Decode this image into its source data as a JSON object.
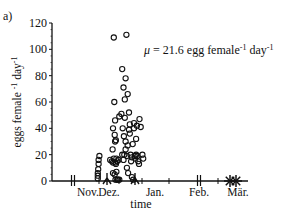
{
  "panel_label": "a)",
  "annotation": {
    "mu": "μ = 21.6 egg female",
    "sup1": "-1",
    "day": " day",
    "sup2": "-1"
  },
  "chart_data": {
    "type": "scatter",
    "title": "",
    "panel": "a)",
    "xlabel": "time",
    "ylabel": "eggs female-1 day-1",
    "ylim": [
      0,
      120
    ],
    "yticks": [
      0,
      20,
      40,
      60,
      80,
      100,
      120
    ],
    "xticklabels": [
      "Nov.",
      "Dez.",
      "Jan.",
      "Feb.",
      "Mär."
    ],
    "grid": false,
    "legend": null,
    "annotations": [
      "μ = 21.6 egg female-1 day-1"
    ],
    "series": [
      {
        "name": "eggs per female per day",
        "marker": "open-circle",
        "points_px_x": [
          78,
          78,
          78,
          80,
          80,
          81,
          82,
          91,
          93,
          95,
          96,
          97,
          97,
          99,
          99,
          100,
          101,
          101,
          102,
          102,
          103,
          103,
          104,
          104,
          105,
          105,
          106,
          106,
          107,
          108,
          108,
          109,
          110,
          111,
          112,
          113,
          114,
          115,
          116,
          117,
          118,
          119,
          119,
          120,
          121,
          122,
          122,
          123,
          123,
          124,
          124,
          125,
          125,
          126,
          126,
          127,
          128,
          129,
          130,
          131,
          132,
          133,
          134,
          136,
          137,
          138,
          139,
          140,
          141,
          142,
          143,
          144,
          145,
          146,
          147,
          148,
          128,
          130,
          131,
          132,
          133,
          134,
          135,
          136,
          137,
          138,
          140,
          141,
          142,
          143,
          144,
          145,
          146,
          147,
          148,
          149,
          150
        ],
        "points": [
          [
            0.62,
            2
          ],
          [
            0.62,
            4
          ],
          [
            0.62,
            6
          ],
          [
            0.63,
            9
          ],
          [
            0.64,
            13
          ],
          [
            0.64,
            16
          ],
          [
            0.66,
            19
          ],
          [
            0.93,
            16
          ],
          [
            0.97,
            15
          ],
          [
            0.99,
            24
          ],
          [
            1.0,
            14
          ],
          [
            1.0,
            6
          ],
          [
            1.0,
            40
          ],
          [
            1.02,
            109
          ],
          [
            1.02,
            17
          ],
          [
            1.03,
            60
          ],
          [
            1.04,
            35
          ],
          [
            1.04,
            5
          ],
          [
            1.05,
            46
          ],
          [
            1.05,
            30
          ],
          [
            1.06,
            14
          ],
          [
            1.06,
            1
          ],
          [
            1.07,
            13
          ],
          [
            1.07,
            31
          ],
          [
            1.08,
            17
          ],
          [
            1.08,
            7
          ],
          [
            1.1,
            15
          ],
          [
            1.1,
            1
          ],
          [
            1.12,
            1
          ],
          [
            1.13,
            16
          ],
          [
            1.15,
            1
          ],
          [
            1.15,
            49
          ],
          [
            1.2,
            51
          ],
          [
            1.22,
            85
          ],
          [
            1.22,
            20
          ],
          [
            1.23,
            40
          ],
          [
            1.25,
            71
          ],
          [
            1.25,
            16
          ],
          [
            1.26,
            34
          ],
          [
            1.27,
            20
          ],
          [
            1.28,
            62
          ],
          [
            1.28,
            48
          ],
          [
            1.3,
            78
          ],
          [
            1.3,
            30
          ],
          [
            1.3,
            24
          ],
          [
            1.32,
            111
          ],
          [
            1.33,
            19
          ],
          [
            1.33,
            10
          ],
          [
            1.35,
            66
          ],
          [
            1.35,
            27
          ],
          [
            1.36,
            6
          ],
          [
            1.38,
            52
          ],
          [
            1.38,
            39
          ],
          [
            1.4,
            43
          ],
          [
            1.4,
            36
          ],
          [
            1.42,
            20
          ],
          [
            1.43,
            15
          ],
          [
            1.45,
            18
          ],
          [
            1.45,
            3
          ],
          [
            1.47,
            28
          ],
          [
            1.48,
            1
          ],
          [
            1.5,
            44
          ],
          [
            1.5,
            40
          ],
          [
            1.52,
            19
          ],
          [
            1.53,
            17
          ],
          [
            1.55,
            32
          ],
          [
            1.55,
            20
          ],
          [
            1.57,
            42
          ],
          [
            1.58,
            19
          ],
          [
            1.6,
            15
          ],
          [
            1.62,
            13
          ],
          [
            1.63,
            47
          ],
          [
            1.66,
            41
          ],
          [
            1.7,
            20
          ],
          [
            1.72,
            17
          ]
        ]
      }
    ],
    "x_axis_markers": [
      {
        "type": "double-tick",
        "x_px": 73
      },
      {
        "type": "tick",
        "x_px": 99
      },
      {
        "type": "cross-tick",
        "x_px": 107
      },
      {
        "type": "tick",
        "x_px": 119
      },
      {
        "type": "cross-tick",
        "x_px": 135
      },
      {
        "type": "tick",
        "x_px": 142
      },
      {
        "type": "tick",
        "x_px": 169
      },
      {
        "type": "double-tick",
        "x_px": 199
      },
      {
        "type": "tick",
        "x_px": 218
      },
      {
        "type": "star",
        "x_px": 230
      },
      {
        "type": "star",
        "x_px": 236
      }
    ]
  }
}
